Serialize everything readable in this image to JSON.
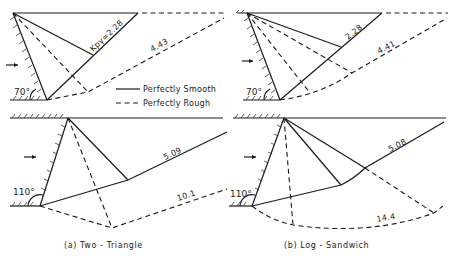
{
  "legend": {
    "solid": "Perfectly Smooth",
    "dashed": "Perfectly Rough"
  },
  "panels": {
    "a": {
      "caption": "(a) Two - Triangle",
      "top": {
        "wall_angle": "70°",
        "smooth_label": "Kpγ=2.28",
        "rough_label": "4.43"
      },
      "bottom": {
        "wall_angle": "110°",
        "smooth_label": "5.09",
        "rough_label": "10.1"
      }
    },
    "b": {
      "caption": "(b) Log - Sandwich",
      "top": {
        "wall_angle": "70°",
        "smooth_label": "2.28",
        "rough_label": "4.41"
      },
      "bottom": {
        "wall_angle": "110°",
        "smooth_label": "5.08",
        "rough_label": "14.4"
      }
    }
  },
  "colors": {
    "ink": "#1a1a1a",
    "background": "#ffffff"
  }
}
